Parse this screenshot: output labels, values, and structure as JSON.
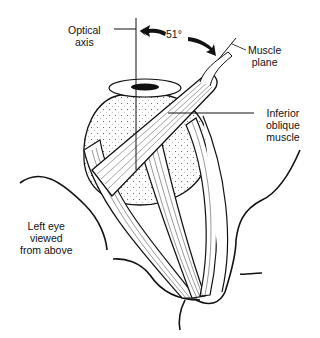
{
  "figure": {
    "labels": {
      "optical_axis": [
        "Optical",
        "axis"
      ],
      "angle": "51°",
      "muscle_plane": [
        "Muscle",
        "plane"
      ],
      "inferior_oblique": [
        "Inferior",
        "oblique",
        "muscle"
      ],
      "caption": [
        "Left eye",
        "viewed",
        "from above"
      ]
    }
  }
}
